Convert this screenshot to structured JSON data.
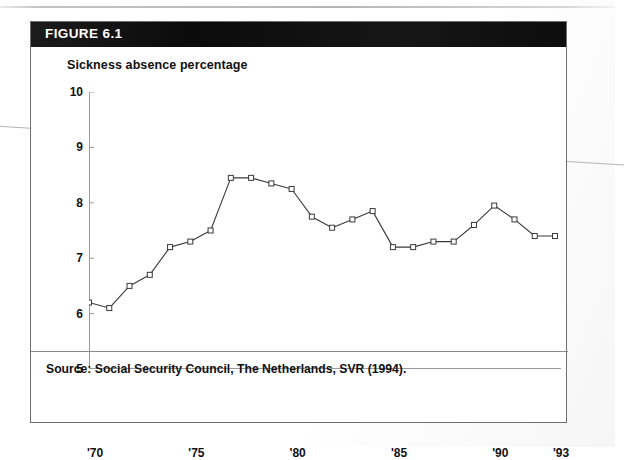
{
  "figure": {
    "number_label": "FIGURE 6.1",
    "title": "Sickness absence percentage",
    "source_caption": "Source: Social Security Council, The Netherlands, SVR (1994)."
  },
  "chart_data": {
    "type": "line",
    "title": "Sickness absence percentage",
    "xlabel": "",
    "ylabel": "Sickness absence percentage",
    "xlim": [
      1970,
      1993
    ],
    "ylim": [
      5,
      10
    ],
    "grid": false,
    "legend": "none",
    "marker": "open-square",
    "line_color": "#3a3a3a",
    "marker_fill": "#ffffff",
    "y_ticks": [
      "5",
      "6",
      "7",
      "8",
      "9",
      "10"
    ],
    "y_tick_values": [
      5,
      6,
      7,
      8,
      9,
      10
    ],
    "x_ticks": [
      "'70",
      "'75",
      "'80",
      "'85",
      "'90",
      "'93"
    ],
    "x_tick_values": [
      1970,
      1975,
      1980,
      1985,
      1990,
      1993
    ],
    "x": [
      1970,
      1971,
      1972,
      1973,
      1974,
      1975,
      1976,
      1977,
      1978,
      1979,
      1980,
      1981,
      1982,
      1983,
      1984,
      1985,
      1986,
      1987,
      1988,
      1989,
      1990,
      1991,
      1992,
      1993
    ],
    "values": [
      6.2,
      6.1,
      6.5,
      6.7,
      7.2,
      7.3,
      7.5,
      8.45,
      8.45,
      8.35,
      8.25,
      7.75,
      7.55,
      7.7,
      7.85,
      7.2,
      7.2,
      7.3,
      7.3,
      7.6,
      7.95,
      7.7,
      7.4,
      7.4
    ]
  }
}
